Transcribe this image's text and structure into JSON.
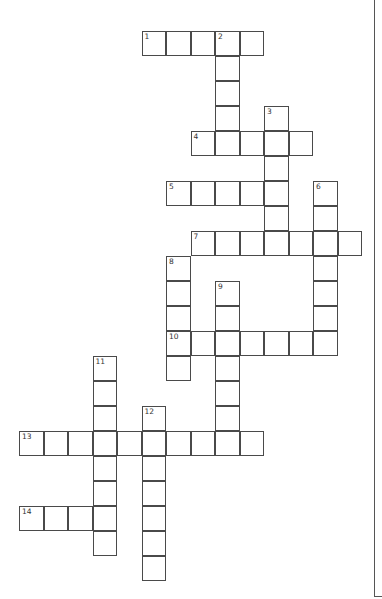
{
  "puzzle": {
    "type": "crossword",
    "grid_origin": {
      "x": 19,
      "y": 31
    },
    "cell_size": {
      "w": 24.5,
      "h": 25
    },
    "colors": {
      "cell_border": "#4a4a4a",
      "cell_fill": "#ffffff",
      "background": "#ffffff",
      "number": "#333333"
    },
    "entries": [
      {
        "number": "1",
        "direction": "across",
        "row": 0,
        "col": 5,
        "length": 5
      },
      {
        "number": "2",
        "direction": "down",
        "row": 0,
        "col": 8,
        "length": 5
      },
      {
        "number": "3",
        "direction": "down",
        "row": 3,
        "col": 10,
        "length": 6
      },
      {
        "number": "4",
        "direction": "across",
        "row": 4,
        "col": 7,
        "length": 5
      },
      {
        "number": "5",
        "direction": "across",
        "row": 6,
        "col": 6,
        "length": 5
      },
      {
        "number": "6",
        "direction": "down",
        "row": 6,
        "col": 12,
        "length": 7
      },
      {
        "number": "7",
        "direction": "across",
        "row": 8,
        "col": 7,
        "length": 7
      },
      {
        "number": "8",
        "direction": "down",
        "row": 9,
        "col": 6,
        "length": 5
      },
      {
        "number": "9",
        "direction": "down",
        "row": 10,
        "col": 8,
        "length": 7
      },
      {
        "number": "10",
        "direction": "across",
        "row": 12,
        "col": 6,
        "length": 7
      },
      {
        "number": "11",
        "direction": "down",
        "row": 13,
        "col": 3,
        "length": 8
      },
      {
        "number": "12",
        "direction": "down",
        "row": 15,
        "col": 5,
        "length": 7
      },
      {
        "number": "13",
        "direction": "across",
        "row": 16,
        "col": 0,
        "length": 10
      },
      {
        "number": "14",
        "direction": "across",
        "row": 19,
        "col": 0,
        "length": 4
      }
    ]
  }
}
